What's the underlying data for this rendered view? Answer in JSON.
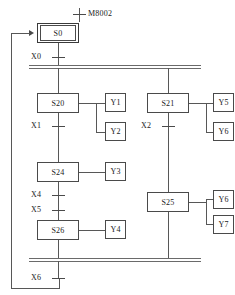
{
  "diagram": {
    "type": "sequential-function-chart",
    "line_color": "#575757",
    "box_border_color": "#4a4a4a",
    "text_color": "#1a1a1a"
  },
  "initial": {
    "transition_label": "M8002",
    "state_label": "S0"
  },
  "divergence": {
    "transition_label": "X0"
  },
  "convergence": {
    "transition_label": "X6"
  },
  "branches": [
    {
      "name": "left-branch",
      "steps": [
        {
          "state": "S20",
          "actions": [
            "Y1",
            "Y2"
          ],
          "next_transition": "X1"
        },
        {
          "state": "S24",
          "actions": [
            "Y3"
          ],
          "next_transition": "X4"
        },
        {
          "state": "S26",
          "actions": [
            "Y4"
          ],
          "next_transition": ""
        }
      ],
      "extra_transitions": [
        "X5"
      ]
    },
    {
      "name": "right-branch",
      "steps": [
        {
          "state": "S21",
          "actions": [
            "Y5",
            "Y6"
          ],
          "next_transition": "X2"
        },
        {
          "state": "S25",
          "actions": [
            "Y6",
            "Y7"
          ],
          "next_transition": ""
        }
      ],
      "extra_transitions": []
    }
  ],
  "states": {
    "s0": "S0",
    "s20": "S20",
    "s24": "S24",
    "s26": "S26",
    "s21": "S21",
    "s25": "S25"
  },
  "actions": {
    "y1": "Y1",
    "y2": "Y2",
    "y3": "Y3",
    "y4": "Y4",
    "y5": "Y5",
    "y6": "Y6",
    "y6b": "Y6",
    "y7": "Y7"
  },
  "transitions": {
    "m8002": "M8002",
    "x0": "X0",
    "x1": "X1",
    "x2": "X2",
    "x4": "X4",
    "x5": "X5",
    "x6": "X6"
  }
}
